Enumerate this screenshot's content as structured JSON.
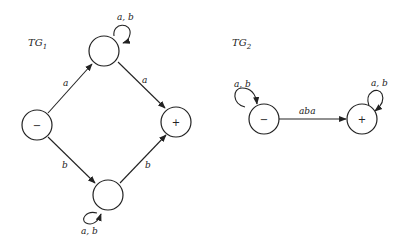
{
  "diagrams": [
    {
      "title": "TG",
      "subscript": "1",
      "nodes": [
        {
          "id": "start",
          "label": "−"
        },
        {
          "id": "top",
          "label": ""
        },
        {
          "id": "bottom",
          "label": ""
        },
        {
          "id": "final",
          "label": "+"
        }
      ],
      "edges": [
        {
          "from": "start",
          "to": "top",
          "label": "a"
        },
        {
          "from": "top",
          "to": "final",
          "label": "a"
        },
        {
          "from": "start",
          "to": "bottom",
          "label": "b"
        },
        {
          "from": "bottom",
          "to": "final",
          "label": "b"
        },
        {
          "from": "top",
          "to": "top",
          "label": "a, b"
        },
        {
          "from": "bottom",
          "to": "bottom",
          "label": "a, b"
        }
      ]
    },
    {
      "title": "TG",
      "subscript": "2",
      "nodes": [
        {
          "id": "start",
          "label": "−"
        },
        {
          "id": "final",
          "label": "+"
        }
      ],
      "edges": [
        {
          "from": "start",
          "to": "start",
          "label": "a, b"
        },
        {
          "from": "start",
          "to": "final",
          "label": "aba"
        },
        {
          "from": "final",
          "to": "final",
          "label": "a, b"
        }
      ]
    }
  ]
}
